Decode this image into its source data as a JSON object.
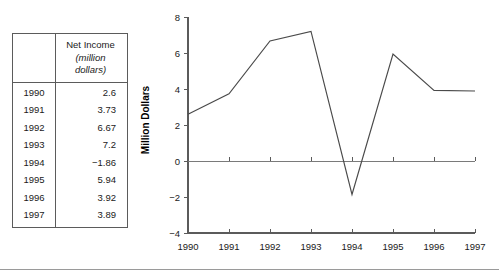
{
  "table": {
    "corner_label": "",
    "header": {
      "main": "Net Income",
      "unit_line1": "(million",
      "unit_line2": "dollars)"
    },
    "row_label_header": "",
    "rows": [
      {
        "year": "1990",
        "value": "2.6"
      },
      {
        "year": "1991",
        "value": "3.73"
      },
      {
        "year": "1992",
        "value": "6.67"
      },
      {
        "year": "1993",
        "value": "7.2"
      },
      {
        "year": "1994",
        "value": "−1.86"
      },
      {
        "year": "1995",
        "value": "5.94"
      },
      {
        "year": "1996",
        "value": "3.92"
      },
      {
        "year": "1997",
        "value": "3.89"
      }
    ]
  },
  "chart_data": {
    "type": "line",
    "title": "",
    "xlabel": "",
    "ylabel": "Million Dollars",
    "categories": [
      "1990",
      "1991",
      "1992",
      "1993",
      "1994",
      "1995",
      "1996",
      "1997"
    ],
    "values": [
      2.6,
      3.73,
      6.67,
      7.2,
      -1.86,
      5.94,
      3.92,
      3.89
    ],
    "series": [
      {
        "name": "Net Income",
        "values": [
          2.6,
          3.73,
          6.67,
          7.2,
          -1.86,
          5.94,
          3.92,
          3.89
        ]
      }
    ],
    "ylim": [
      -4,
      8
    ],
    "xlim": [
      "1990",
      "1997"
    ],
    "ytick_labels": [
      "8",
      "6",
      "4",
      "2",
      "0",
      "−2",
      "−4"
    ],
    "ytick_values": [
      8,
      6,
      4,
      2,
      0,
      -2,
      -4
    ],
    "xtick_labels": [
      "1990",
      "1991",
      "1992",
      "1993",
      "1994",
      "1995",
      "1996",
      "1997"
    ],
    "grid": false,
    "legend": false,
    "zero_reference_line": true,
    "line_color": "#4a4a4a",
    "axis_color": "#5b5b5b"
  },
  "colors": {
    "background": "#ffffff",
    "text": "#1a1a1a",
    "axis": "#5b5b5b",
    "line": "#4a4a4a",
    "table_border": "#5b5b5b",
    "footer_rule": "#9a9a9a"
  }
}
